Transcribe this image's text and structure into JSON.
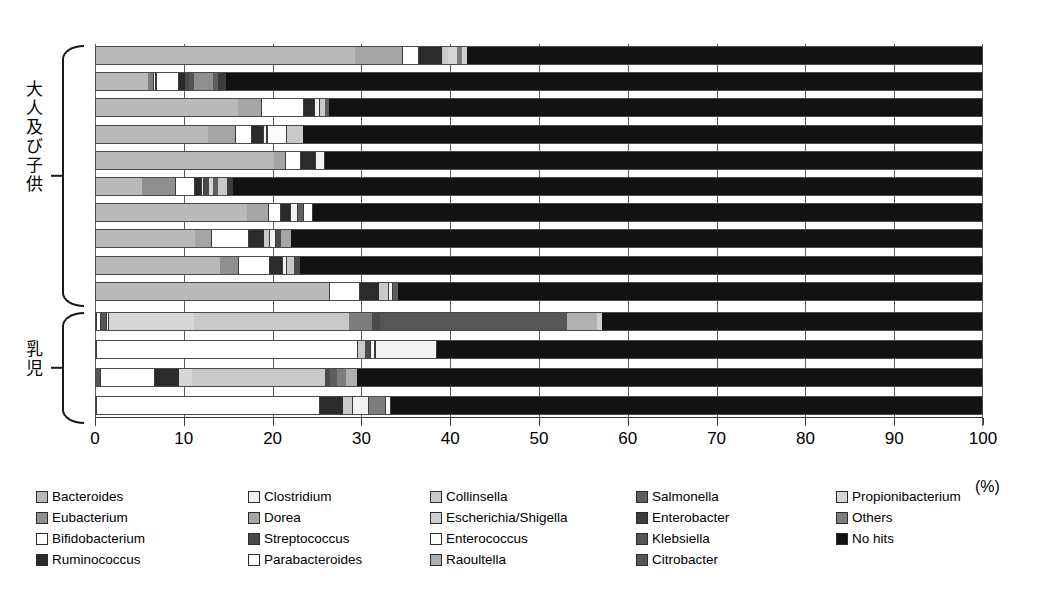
{
  "axis": {
    "ticks": [
      0,
      10,
      20,
      30,
      40,
      50,
      60,
      70,
      80,
      90,
      100
    ],
    "unit_label": "(%)",
    "min": 0,
    "max": 100
  },
  "groups": [
    {
      "label": "大人及び子供",
      "row_start": 0,
      "row_count": 10
    },
    {
      "label": "乳児",
      "row_start": 10,
      "row_count": 4
    }
  ],
  "legend": {
    "columns": 5,
    "rows": 4,
    "items": [
      {
        "label": "Bacteroides",
        "color": "#b9b9b9"
      },
      {
        "label": "Eubacterium",
        "color": "#8f8f8f"
      },
      {
        "label": "Bifidobacterium",
        "color": "#ffffff"
      },
      {
        "label": "Ruminococcus",
        "color": "#2b2b2b"
      },
      {
        "label": "Clostridium",
        "color": "#f2f2f2"
      },
      {
        "label": "Dorea",
        "color": "#a5a5a5"
      },
      {
        "label": "Streptococcus",
        "color": "#4a4a4a"
      },
      {
        "label": "Parabacteroides",
        "color": "#fbfbfb"
      },
      {
        "label": "Collinsella",
        "color": "#c9c9c9"
      },
      {
        "label": "Escherichia/Shigella",
        "color": "#cfcfcf"
      },
      {
        "label": "Enterococcus",
        "color": "#ffffff"
      },
      {
        "label": "Raoultella",
        "color": "#b0b0b0"
      },
      {
        "label": "Salmonella",
        "color": "#5e5e5e"
      },
      {
        "label": "Enterobacter",
        "color": "#3c3c3c"
      },
      {
        "label": "Klebsiella",
        "color": "#565656"
      },
      {
        "label": "Citrobacter",
        "color": "#555555"
      },
      {
        "label": "Propionibacterium",
        "color": "#d6d6d6"
      },
      {
        "label": "Others",
        "color": "#7d7d7d"
      },
      {
        "label": "No hits",
        "color": "#121212"
      }
    ]
  },
  "chart_data": {
    "type": "bar",
    "orientation": "horizontal",
    "stacked": "percent",
    "title": "",
    "xlabel": "(%)",
    "ylabel": "",
    "xlim": [
      0,
      100
    ],
    "grid": true,
    "legend_position": "bottom",
    "categories": [
      "Adult/Child 1",
      "Adult/Child 2",
      "Adult/Child 3",
      "Adult/Child 4",
      "Adult/Child 5",
      "Adult/Child 6",
      "Adult/Child 7",
      "Adult/Child 8",
      "Adult/Child 9",
      "Adult/Child 10",
      "Infant 1",
      "Infant 2",
      "Infant 3",
      "Infant 4"
    ],
    "series_order": [
      "Bacteroides",
      "Eubacterium",
      "Bifidobacterium",
      "Ruminococcus",
      "Clostridium",
      "Dorea",
      "Streptococcus",
      "Parabacteroides",
      "Collinsella",
      "Escherichia/Shigella",
      "Enterococcus",
      "Raoultella",
      "Salmonella",
      "Enterobacter",
      "Klebsiella",
      "Citrobacter",
      "Propionibacterium",
      "Others",
      "No hits"
    ],
    "bars": [
      {
        "row": 0,
        "segments": [
          {
            "taxon": "Bacteroides",
            "value": 29.2
          },
          {
            "taxon": "Dorea",
            "value": 5.3
          },
          {
            "taxon": "Bifidobacterium",
            "value": 1.9
          },
          {
            "taxon": "Ruminococcus",
            "value": 2.6
          },
          {
            "taxon": "Collinsella",
            "value": 0.6
          },
          {
            "taxon": "Propionibacterium",
            "value": 1.1
          },
          {
            "taxon": "Others",
            "value": 0.5
          },
          {
            "taxon": "Escherichia/Shigella",
            "value": 0.6
          },
          {
            "taxon": "No hits",
            "value": 58.2
          }
        ]
      },
      {
        "row": 1,
        "segments": [
          {
            "taxon": "Bacteroides",
            "value": 5.9
          },
          {
            "taxon": "Others",
            "value": 0.5
          },
          {
            "taxon": "Clostridium",
            "value": 0.4
          },
          {
            "taxon": "Bifidobacterium",
            "value": 2.6
          },
          {
            "taxon": "Ruminococcus",
            "value": 0.6
          },
          {
            "taxon": "Streptococcus",
            "value": 0.5
          },
          {
            "taxon": "Citrobacter",
            "value": 0.5
          },
          {
            "taxon": "Eubacterium",
            "value": 2.2
          },
          {
            "taxon": "Salmonella",
            "value": 0.6
          },
          {
            "taxon": "Enterobacter",
            "value": 0.8
          },
          {
            "taxon": "No hits",
            "value": 85.4
          }
        ]
      },
      {
        "row": 2,
        "segments": [
          {
            "taxon": "Bacteroides",
            "value": 16.0
          },
          {
            "taxon": "Dorea",
            "value": 2.6
          },
          {
            "taxon": "Bifidobacterium",
            "value": 4.8
          },
          {
            "taxon": "Ruminococcus",
            "value": 1.1
          },
          {
            "taxon": "Clostridium",
            "value": 0.7
          },
          {
            "taxon": "Collinsella",
            "value": 0.6
          },
          {
            "taxon": "Salmonella",
            "value": 0.5
          },
          {
            "taxon": "No hits",
            "value": 73.7
          }
        ]
      },
      {
        "row": 3,
        "segments": [
          {
            "taxon": "Bacteroides",
            "value": 12.6
          },
          {
            "taxon": "Dorea",
            "value": 3.0
          },
          {
            "taxon": "Bifidobacterium",
            "value": 2.0
          },
          {
            "taxon": "Ruminococcus",
            "value": 1.2
          },
          {
            "taxon": "Clostridium",
            "value": 0.5
          },
          {
            "taxon": "Parabacteroides",
            "value": 2.2
          },
          {
            "taxon": "Collinsella",
            "value": 1.8
          },
          {
            "taxon": "No hits",
            "value": 76.7
          }
        ]
      },
      {
        "row": 4,
        "segments": [
          {
            "taxon": "Bacteroides",
            "value": 20.0
          },
          {
            "taxon": "Dorea",
            "value": 1.3
          },
          {
            "taxon": "Bifidobacterium",
            "value": 1.8
          },
          {
            "taxon": "Ruminococcus",
            "value": 1.6
          },
          {
            "taxon": "Clostridium",
            "value": 1.1
          },
          {
            "taxon": "No hits",
            "value": 74.2
          }
        ]
      },
      {
        "row": 5,
        "segments": [
          {
            "taxon": "Bacteroides",
            "value": 5.2
          },
          {
            "taxon": "Eubacterium",
            "value": 3.7
          },
          {
            "taxon": "Bifidobacterium",
            "value": 2.3
          },
          {
            "taxon": "Ruminococcus",
            "value": 0.6
          },
          {
            "taxon": "Clostridium",
            "value": 0.4
          },
          {
            "taxon": "Streptococcus",
            "value": 0.5
          },
          {
            "taxon": "Propionibacterium",
            "value": 0.5
          },
          {
            "taxon": "Salmonella",
            "value": 0.6
          },
          {
            "taxon": "Collinsella",
            "value": 1.0
          },
          {
            "taxon": "Enterobacter",
            "value": 0.6
          },
          {
            "taxon": "No hits",
            "value": 84.6
          }
        ]
      },
      {
        "row": 6,
        "segments": [
          {
            "taxon": "Bacteroides",
            "value": 17.0
          },
          {
            "taxon": "Dorea",
            "value": 2.4
          },
          {
            "taxon": "Bifidobacterium",
            "value": 1.4
          },
          {
            "taxon": "Ruminococcus",
            "value": 1.0
          },
          {
            "taxon": "Clostridium",
            "value": 0.9
          },
          {
            "taxon": "Salmonella",
            "value": 0.6
          },
          {
            "taxon": "Parabacteroides",
            "value": 1.2
          },
          {
            "taxon": "No hits",
            "value": 75.5
          }
        ]
      },
      {
        "row": 7,
        "segments": [
          {
            "taxon": "Bacteroides",
            "value": 11.2
          },
          {
            "taxon": "Dorea",
            "value": 1.7
          },
          {
            "taxon": "Bifidobacterium",
            "value": 4.3
          },
          {
            "taxon": "Ruminococcus",
            "value": 1.7
          },
          {
            "taxon": "Collinsella",
            "value": 0.6
          },
          {
            "taxon": "Clostridium",
            "value": 0.8
          },
          {
            "taxon": "Streptococcus",
            "value": 0.5
          },
          {
            "taxon": "Dorea",
            "value": 1.2
          },
          {
            "taxon": "No hits",
            "value": 78.0
          }
        ]
      },
      {
        "row": 8,
        "segments": [
          {
            "taxon": "Bacteroides",
            "value": 14.0
          },
          {
            "taxon": "Eubacterium",
            "value": 2.0
          },
          {
            "taxon": "Bifidobacterium",
            "value": 3.6
          },
          {
            "taxon": "Ruminococcus",
            "value": 1.3
          },
          {
            "taxon": "Clostridium",
            "value": 0.6
          },
          {
            "taxon": "Collinsella",
            "value": 0.8
          },
          {
            "taxon": "Streptococcus",
            "value": 0.7
          },
          {
            "taxon": "No hits",
            "value": 77.0
          }
        ]
      },
      {
        "row": 9,
        "segments": [
          {
            "taxon": "Bacteroides",
            "value": 26.2
          },
          {
            "taxon": "Bifidobacterium",
            "value": 3.5
          },
          {
            "taxon": "Ruminococcus",
            "value": 2.2
          },
          {
            "taxon": "Collinsella",
            "value": 1.0
          },
          {
            "taxon": "Clostridium",
            "value": 0.5
          },
          {
            "taxon": "Salmonella",
            "value": 0.6
          },
          {
            "taxon": "No hits",
            "value": 66.0
          }
        ]
      },
      {
        "row": 10,
        "segments": [
          {
            "taxon": "Enterococcus",
            "value": 0.6
          },
          {
            "taxon": "Citrobacter",
            "value": 0.5
          },
          {
            "taxon": "Bifidobacterium",
            "value": 0.4
          },
          {
            "taxon": "Propionibacterium",
            "value": 9.5
          },
          {
            "taxon": "Collinsella",
            "value": 17.5
          },
          {
            "taxon": "Others",
            "value": 2.6
          },
          {
            "taxon": "Streptococcus",
            "value": 0.9
          },
          {
            "taxon": "Klebsiella",
            "value": 21.0
          },
          {
            "taxon": "Raoultella",
            "value": 3.4
          },
          {
            "taxon": "Escherichia/Shigella",
            "value": 0.6
          },
          {
            "taxon": "No hits",
            "value": 43.0
          }
        ]
      },
      {
        "row": 11,
        "segments": [
          {
            "taxon": "Bifidobacterium",
            "value": 29.5
          },
          {
            "taxon": "Collinsella",
            "value": 0.8
          },
          {
            "taxon": "Streptococcus",
            "value": 0.6
          },
          {
            "taxon": "Parabacteroides",
            "value": 0.5
          },
          {
            "taxon": "Clostridium",
            "value": 7.0
          },
          {
            "taxon": "No hits",
            "value": 61.6
          }
        ]
      },
      {
        "row": 12,
        "segments": [
          {
            "taxon": "Citrobacter",
            "value": 0.4
          },
          {
            "taxon": "Enterococcus",
            "value": 6.3
          },
          {
            "taxon": "Ruminococcus",
            "value": 2.6
          },
          {
            "taxon": "Propionibacterium",
            "value": 1.5
          },
          {
            "taxon": "Collinsella",
            "value": 15.0
          },
          {
            "taxon": "Streptococcus",
            "value": 0.6
          },
          {
            "taxon": "Salmonella",
            "value": 0.8
          },
          {
            "taxon": "Others",
            "value": 1.0
          },
          {
            "taxon": "Raoultella",
            "value": 1.2
          },
          {
            "taxon": "No hits",
            "value": 70.6
          }
        ]
      },
      {
        "row": 13,
        "segments": [
          {
            "taxon": "Bifidobacterium",
            "value": 25.2
          },
          {
            "taxon": "Ruminococcus",
            "value": 2.6
          },
          {
            "taxon": "Collinsella",
            "value": 1.0
          },
          {
            "taxon": "Clostridium",
            "value": 2.0
          },
          {
            "taxon": "Others",
            "value": 1.8
          },
          {
            "taxon": "Parabacteroides",
            "value": 0.6
          },
          {
            "taxon": "No hits",
            "value": 66.8
          }
        ]
      }
    ]
  }
}
